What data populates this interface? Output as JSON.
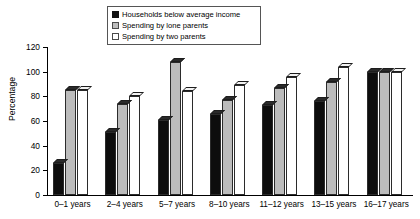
{
  "chart_data": {
    "type": "bar",
    "title": "",
    "xlabel": "",
    "ylabel": "Percentage",
    "ylim": [
      0,
      120
    ],
    "yticks": [
      0,
      20,
      40,
      60,
      80,
      100,
      120
    ],
    "grid": false,
    "legend_position": "top-center",
    "categories": [
      "0–1 years",
      "2–4 years",
      "5–7 years",
      "8–10 years",
      "11–12 years",
      "13–15 years",
      "16–17 years"
    ],
    "series": [
      {
        "name": "Households below average income",
        "color": "#0d0d0d",
        "values": [
          26,
          51,
          61,
          66,
          73,
          76,
          100
        ]
      },
      {
        "name": "Spending by lone parents",
        "color": "#bcbcbc",
        "values": [
          85,
          74,
          108,
          77,
          87,
          92,
          100
        ]
      },
      {
        "name": "Spending by two parents",
        "color": "#ffffff",
        "values": [
          85,
          80,
          84,
          89,
          96,
          104,
          100
        ]
      }
    ]
  },
  "legend": {
    "items": [
      {
        "label": "Households below average income",
        "swatch": "black-square-swatch"
      },
      {
        "label": "Spending by lone parents",
        "swatch": "grey-square-swatch"
      },
      {
        "label": "Spending by two parents",
        "swatch": "white-square-swatch"
      }
    ]
  },
  "axes": {
    "y_title": "Percentage",
    "y_tick_labels": [
      "0",
      "20",
      "40",
      "60",
      "80",
      "100",
      "120"
    ],
    "x_tick_labels": [
      "0–1 years",
      "2–4 years",
      "5–7 years",
      "8–10 years",
      "11–12 years",
      "13–15 years",
      "16–17 years"
    ]
  },
  "title_partial": " "
}
